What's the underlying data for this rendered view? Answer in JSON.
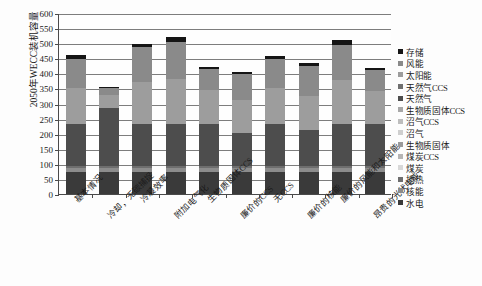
{
  "chart_data": {
    "type": "bar",
    "stacked": true,
    "title": "",
    "xlabel": "",
    "ylabel": "2050年WECC装机容量",
    "ylim": [
      0,
      600
    ],
    "ytick_step": 50,
    "yticks": [
      0,
      50,
      100,
      150,
      200,
      250,
      300,
      350,
      400,
      450,
      500,
      550,
      600
    ],
    "grid": "horizontal",
    "legend_position": "right",
    "categories": [
      "基本情况",
      "冷却，无碳捕捉",
      "冷凝效率",
      "附加电气化",
      "生物质固体CCS",
      "廉价的CCS",
      "无CCS",
      "廉价的核能",
      "廉价的风能和太阳能",
      "昂贵的光伏电能"
    ],
    "series": [
      {
        "name": "水电",
        "color": "#3a3a3a",
        "values": [
          72,
          72,
          72,
          72,
          72,
          72,
          72,
          72,
          72,
          72
        ]
      },
      {
        "name": "核能",
        "color": "#8c8c8c",
        "values": [
          14,
          14,
          14,
          14,
          14,
          14,
          14,
          14,
          14,
          14
        ]
      },
      {
        "name": "地热",
        "color": "#6e6e6e",
        "values": [
          6,
          6,
          6,
          6,
          6,
          6,
          6,
          6,
          6,
          6
        ]
      },
      {
        "name": "煤炭",
        "color": "#d8d8d8",
        "values": [
          0,
          0,
          0,
          0,
          0,
          0,
          0,
          0,
          0,
          0
        ]
      },
      {
        "name": "煤炭CCS",
        "color": "#b5b5b5",
        "values": [
          0,
          0,
          0,
          0,
          0,
          0,
          0,
          0,
          0,
          0
        ]
      },
      {
        "name": "生物质固体",
        "color": "#9a9a9a",
        "values": [
          0,
          0,
          0,
          0,
          0,
          0,
          0,
          0,
          0,
          0
        ]
      },
      {
        "name": "沼气",
        "color": "#cfcfcf",
        "values": [
          0,
          0,
          0,
          0,
          0,
          0,
          0,
          0,
          0,
          0
        ]
      },
      {
        "name": "沼气CCS",
        "color": "#bdbdbd",
        "values": [
          0,
          0,
          0,
          0,
          0,
          0,
          0,
          0,
          0,
          0
        ]
      },
      {
        "name": "生物质固体CCS",
        "color": "#a8a8a8",
        "values": [
          0,
          0,
          0,
          0,
          0,
          0,
          0,
          0,
          0,
          0
        ]
      },
      {
        "name": "天然气",
        "color": "#4d4d4d",
        "values": [
          140,
          192,
          140,
          140,
          140,
          110,
          140,
          120,
          140,
          140
        ]
      },
      {
        "name": "天然气CCS",
        "color": "#707070",
        "values": [
          0,
          0,
          0,
          0,
          0,
          0,
          0,
          0,
          0,
          0
        ]
      },
      {
        "name": "太阳能",
        "color": "#9d9d9d",
        "values": [
          120,
          44,
          140,
          150,
          112,
          110,
          120,
          112,
          145,
          108
        ]
      },
      {
        "name": "风能",
        "color": "#8a8a8a",
        "values": [
          96,
          24,
          114,
          122,
          72,
          86,
          94,
          102,
          118,
          70
        ]
      },
      {
        "name": "存储",
        "color": "#151515",
        "values": [
          12,
          4,
          12,
          16,
          6,
          6,
          12,
          8,
          14,
          8
        ]
      }
    ]
  },
  "legend": {
    "items": [
      {
        "label": "存储",
        "color": "#151515"
      },
      {
        "label": "风能",
        "color": "#8a8a8a"
      },
      {
        "label": "太阳能",
        "color": "#9d9d9d"
      },
      {
        "label": "天然气CCS",
        "color": "#707070"
      },
      {
        "label": "天然气",
        "color": "#4d4d4d"
      },
      {
        "label": "生物质固体CCS",
        "color": "#a8a8a8"
      },
      {
        "label": "沼气CCS",
        "color": "#bdbdbd"
      },
      {
        "label": "沼气",
        "color": "#cfcfcf"
      },
      {
        "label": "生物质固体",
        "color": "#9a9a9a"
      },
      {
        "label": "煤炭CCS",
        "color": "#b5b5b5"
      },
      {
        "label": "煤炭",
        "color": "#d8d8d8"
      },
      {
        "label": "地热",
        "color": "#6e6e6e"
      },
      {
        "label": "核能",
        "color": "#8c8c8c"
      },
      {
        "label": "水电",
        "color": "#3a3a3a"
      }
    ]
  }
}
